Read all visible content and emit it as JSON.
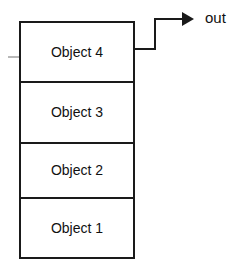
{
  "diagram": {
    "background_color": "#ffffff",
    "line_color": "#1a1a1a",
    "text_color": "#111111",
    "tick_color": "#9a9a9a",
    "stack": {
      "name": "object-stack",
      "x": 20,
      "y": 22,
      "width": 114,
      "height": 236,
      "cells": [
        {
          "label": "Object 4",
          "x": 20,
          "y": 22,
          "width": 114,
          "height": 60,
          "center_x": 77,
          "center_y": 53
        },
        {
          "label": "Object 3",
          "x": 20,
          "y": 82,
          "width": 114,
          "height": 61,
          "center_x": 77,
          "center_y": 113
        },
        {
          "label": "Object 2",
          "x": 20,
          "y": 143,
          "width": 114,
          "height": 55,
          "center_x": 77,
          "center_y": 171
        },
        {
          "label": "Object 1",
          "x": 20,
          "y": 198,
          "width": 114,
          "height": 60,
          "center_x": 77,
          "center_y": 229
        }
      ]
    },
    "connector": {
      "name": "output-connector",
      "path": "M 134 49 L 155 49 L 155 19 L 182 19",
      "arrow_head_points": "182,12 194,19 182,26",
      "source_cell": "Object 4",
      "target_label": "out"
    },
    "out_label": {
      "text": "out",
      "x": 205,
      "y": 19
    },
    "left_tick": {
      "name": "left-tick-mark",
      "x1": 8,
      "y1": 57,
      "x2": 19,
      "y2": 57
    }
  }
}
